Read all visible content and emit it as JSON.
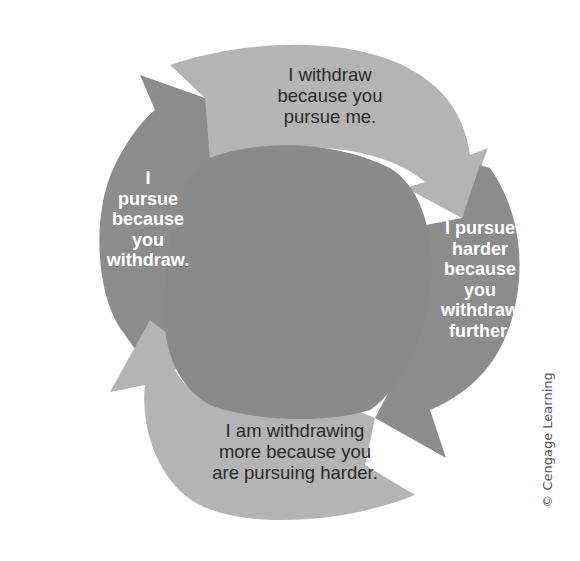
{
  "diagram": {
    "type": "cycle",
    "colors": {
      "light_arrow": "#b4b4b4",
      "dark_arrow": "#8c8c8c",
      "center": "#8a8a8a",
      "dark_label_text": "#2a2a2a",
      "light_label_text": "#ffffff"
    },
    "nodes": [
      {
        "id": "top",
        "position": "top",
        "text": "I withdraw because you pursue me.",
        "lines": [
          "I withdraw",
          "because you",
          "pursue me."
        ]
      },
      {
        "id": "right",
        "position": "right",
        "text": "I pursue harder because you withdraw further.",
        "lines": [
          "I pursue",
          "harder",
          "because",
          "you",
          "withdraw",
          "further."
        ]
      },
      {
        "id": "bottom",
        "position": "bottom",
        "text": "I am withdrawing more because you are pursuing harder.",
        "lines": [
          "I am withdrawing",
          "more because you",
          "are pursuing harder."
        ]
      },
      {
        "id": "left",
        "position": "left",
        "text": "I pursue because you withdraw.",
        "lines": [
          "I",
          "pursue",
          "because",
          "you",
          "withdraw."
        ]
      }
    ],
    "edges": [
      {
        "from": "left",
        "to": "top"
      },
      {
        "from": "top",
        "to": "right"
      },
      {
        "from": "right",
        "to": "bottom"
      },
      {
        "from": "bottom",
        "to": "left"
      }
    ]
  },
  "credit": "© Cengage Learning"
}
